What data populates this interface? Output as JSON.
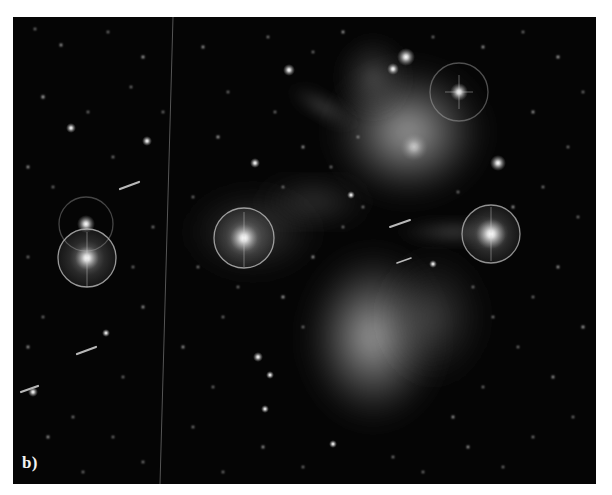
{
  "figure": {
    "panel_label": "b)",
    "colors": {
      "background": "#050505",
      "nebula": "#c8c8c8",
      "star": "#ffffff",
      "page": "#ffffff"
    },
    "bright_stars": [
      {
        "name": "star-left-halo",
        "x": 74,
        "y": 241,
        "halo_r": 29
      },
      {
        "name": "star-left-upper",
        "x": 73,
        "y": 207,
        "halo_r": 27
      },
      {
        "name": "star-center-halo",
        "x": 231,
        "y": 221,
        "halo_r": 30
      },
      {
        "name": "star-right-halo",
        "x": 478,
        "y": 217,
        "halo_r": 29
      },
      {
        "name": "star-top-right-halo",
        "x": 446,
        "y": 75,
        "halo_r": 29
      },
      {
        "name": "star-top-1",
        "x": 393,
        "y": 40
      },
      {
        "name": "star-top-2",
        "x": 380,
        "y": 52
      },
      {
        "name": "star-upper-left-mid",
        "x": 276,
        "y": 53
      },
      {
        "name": "star-right-mid",
        "x": 485,
        "y": 146
      }
    ],
    "artifacts": [
      "vertical-scratch-line",
      "satellite-trails"
    ]
  }
}
